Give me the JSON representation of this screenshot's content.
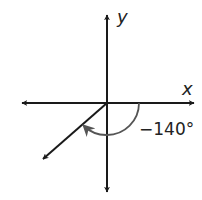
{
  "diagram": {
    "type": "angle-in-standard-position",
    "axes": {
      "x_label": "x",
      "y_label": "y"
    },
    "angle": {
      "label": "−140°",
      "degrees": -140,
      "direction": "clockwise",
      "initial_side": "positive x-axis",
      "terminal_quadrant": "III"
    },
    "colors": {
      "axes": "#1a1a1a",
      "arc": "#555555",
      "text": "#222222",
      "background": "#ffffff"
    }
  }
}
